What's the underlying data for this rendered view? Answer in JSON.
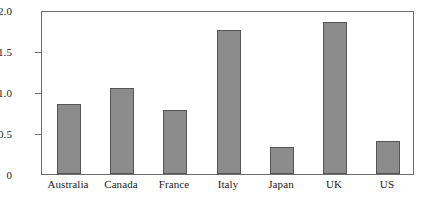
{
  "chart_data": {
    "type": "bar",
    "title": "",
    "subtitle": "",
    "xlabel": "",
    "ylabel": "",
    "categories": [
      "Australia",
      "Canada",
      "France",
      "Italy",
      "Japan",
      "UK",
      "US"
    ],
    "values": [
      -0.85,
      -1.05,
      -0.78,
      -1.75,
      -0.33,
      -1.85,
      -0.4
    ],
    "series": [
      {
        "name": "",
        "values": [
          -0.85,
          -1.05,
          -0.78,
          -1.75,
          -0.33,
          -1.85,
          -0.4
        ]
      }
    ],
    "ylim": [
      0,
      -2.0
    ],
    "y_axis_inverted": true,
    "yticks": [
      -2.0,
      -1.5,
      -1.0,
      -0.5,
      0
    ],
    "ytick_labels": [
      "−2.0",
      "−1.5",
      "−1.0",
      "−0.5",
      "0"
    ],
    "grid": false,
    "legend": false,
    "legend_position": "none",
    "bar_color": "#8c8c8c",
    "bar_edge_color": "#555555",
    "axis_color": "#6e6e6e",
    "background_color": "#ffffff"
  }
}
